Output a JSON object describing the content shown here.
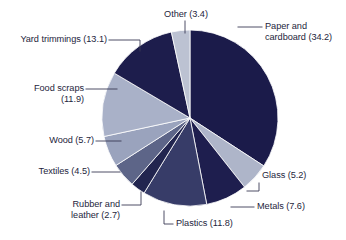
{
  "chart_data": {
    "type": "pie",
    "title": "",
    "subtitle": "",
    "xlabel": "",
    "ylabel": "",
    "legend_position": "callout-labels",
    "grid": false,
    "units": "percent",
    "total": 100.1,
    "categories": [
      "Paper and cardboard",
      "Glass",
      "Metals",
      "Plastics",
      "Rubber and leather",
      "Textiles",
      "Wood",
      "Food scraps",
      "Yard trimmings",
      "Other"
    ],
    "values": [
      34.2,
      5.2,
      7.6,
      11.8,
      2.7,
      4.5,
      5.7,
      11.9,
      13.1,
      3.4
    ],
    "slices": [
      {
        "name": "Paper and cardboard",
        "value": 34.2,
        "color": "#1b1b4a",
        "label": "Paper and cardboard (34.2)",
        "label_line1": "Paper and",
        "label_line2": "cardboard (34.2)"
      },
      {
        "name": "Glass",
        "value": 5.2,
        "color": "#aeb5c9",
        "label": "Glass (5.2)",
        "label_line1": "Glass (5.2)",
        "label_line2": ""
      },
      {
        "name": "Metals",
        "value": 7.6,
        "color": "#1e1e4e",
        "label": "Metals (7.6)",
        "label_line1": "Metals (7.6)",
        "label_line2": ""
      },
      {
        "name": "Plastics",
        "value": 11.8,
        "color": "#373c68",
        "label": "Plastics (11.8)",
        "label_line1": "Plastics (11.8)",
        "label_line2": ""
      },
      {
        "name": "Rubber and leather",
        "value": 2.7,
        "color": "#22254f",
        "label": "Rubber and leather (2.7)",
        "label_line1": "Rubber and",
        "label_line2": "leather (2.7)"
      },
      {
        "name": "Textiles",
        "value": 4.5,
        "color": "#5d6588",
        "label": "Textiles (4.5)",
        "label_line1": "Textiles (4.5)",
        "label_line2": ""
      },
      {
        "name": "Wood",
        "value": 5.7,
        "color": "#9aa3bd",
        "label": "Wood (5.7)",
        "label_line1": "Wood (5.7)",
        "label_line2": ""
      },
      {
        "name": "Food scraps",
        "value": 11.9,
        "color": "#a9b1c8",
        "label": "Food scraps (11.9)",
        "label_line1": "Food scraps",
        "label_line2": "(11.9)"
      },
      {
        "name": "Yard trimmings",
        "value": 13.1,
        "color": "#1d1d4c",
        "label": "Yard trimmings (13.1)",
        "label_line1": "Yard trimmings (13.1)",
        "label_line2": ""
      },
      {
        "name": "Other",
        "value": 3.4,
        "color": "#bcc2d2",
        "label": "Other (3.4)",
        "label_line1": "Other (3.4)",
        "label_line2": ""
      }
    ],
    "colors": {
      "dark_navy": "#1b1b4a",
      "mid_navy": "#373c68",
      "slate": "#5d6588",
      "light_slate": "#9aa3bd",
      "light_gray_blue": "#a9b1c8",
      "pale": "#bcc2d2",
      "leader_line": "#3a3a55",
      "background": "#ffffff",
      "text": "#1e1e3c"
    }
  }
}
